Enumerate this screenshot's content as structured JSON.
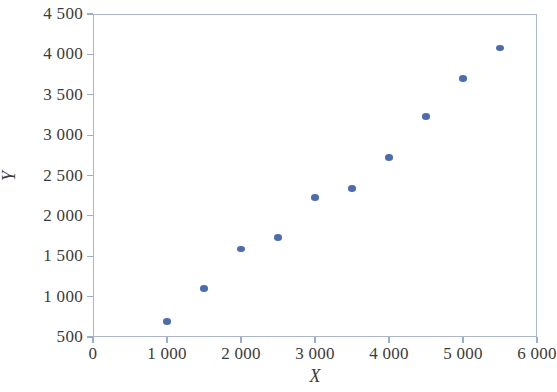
{
  "chart_data": {
    "type": "scatter",
    "title": "",
    "xlabel": "X",
    "ylabel": "Y",
    "xlim": [
      0,
      6000
    ],
    "ylim": [
      500,
      4500
    ],
    "grid": false,
    "legend": null,
    "marker_color": "#4a6cb3",
    "axis_color": "#a9b6d8",
    "text_color": "#3b3b3b",
    "xticks": [
      0,
      1000,
      2000,
      3000,
      4000,
      5000,
      6000
    ],
    "xticklabels": [
      "0",
      "1 000",
      "2 000",
      "3 000",
      "4 000",
      "5 000",
      "6 000"
    ],
    "yticks": [
      500,
      1000,
      1500,
      2000,
      2500,
      3000,
      3500,
      4000,
      4500
    ],
    "yticklabels": [
      "500",
      "1 000",
      "1 500",
      "2 000",
      "2 500",
      "3 000",
      "3 500",
      "4 000",
      "4 500"
    ],
    "x": [
      1000,
      1500,
      2000,
      2500,
      3000,
      3500,
      4000,
      4500,
      5000,
      5500
    ],
    "y": [
      690,
      1100,
      1590,
      1730,
      2230,
      2340,
      2720,
      3230,
      3700,
      4080
    ],
    "points": [
      {
        "x": 1000,
        "y": 690
      },
      {
        "x": 1500,
        "y": 1100
      },
      {
        "x": 2000,
        "y": 1590
      },
      {
        "x": 2500,
        "y": 1730
      },
      {
        "x": 3000,
        "y": 2230
      },
      {
        "x": 3500,
        "y": 2340
      },
      {
        "x": 4000,
        "y": 2720
      },
      {
        "x": 4500,
        "y": 3230
      },
      {
        "x": 5000,
        "y": 3700
      },
      {
        "x": 5500,
        "y": 4080
      }
    ]
  }
}
